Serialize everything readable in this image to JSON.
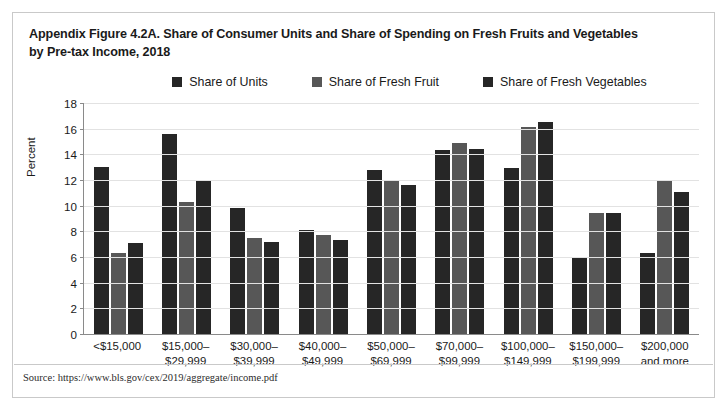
{
  "figure": {
    "title_line1": "Appendix Figure 4.2A. Share of Consumer Units and Share of Spending on Fresh Fruits and Vegetables",
    "title_line2": "by Pre-tax Income, 2018",
    "source": "Source: https://www.bls.gov/cex/2019/aggregate/income.pdf"
  },
  "colors": {
    "series1": "#262626",
    "series2": "#575757",
    "series3": "#262626",
    "axis": "#8a8a8a",
    "grid": "#e2e2e2",
    "border": "#c9c9c9",
    "text": "#1a1a1a"
  },
  "chart_data": {
    "type": "bar",
    "title": "Appendix Figure 4.2A. Share of Consumer Units and Share of Spending on Fresh Fruits and Vegetables by Pre-tax Income, 2018",
    "xlabel": "",
    "ylabel": "Percent",
    "ylim": [
      0,
      18
    ],
    "yticks": [
      0,
      2,
      4,
      6,
      8,
      10,
      12,
      14,
      16,
      18
    ],
    "grid": true,
    "legend_position": "top-center",
    "categories": [
      "<$15,000",
      "$15,000–\n$29,999",
      "$30,000–\n$39,999",
      "$40,000–\n$49,999",
      "$50,000–\n$69,999",
      "$70,000–\n$99,999",
      "$100,000–\n$149,999",
      "$150,000–\n$199,999",
      "$200,000\nand more"
    ],
    "series": [
      {
        "name": "Share of Units",
        "color": "#262626",
        "values": [
          13.0,
          15.6,
          9.8,
          8.1,
          12.8,
          14.3,
          12.9,
          6.0,
          6.3
        ]
      },
      {
        "name": "Share of Fresh Fruit",
        "color": "#575757",
        "values": [
          6.3,
          10.3,
          7.5,
          7.7,
          12.0,
          14.9,
          16.1,
          9.4,
          12.0
        ]
      },
      {
        "name": "Share of Fresh Vegetables",
        "color": "#262626",
        "values": [
          7.1,
          12.0,
          7.2,
          7.3,
          11.6,
          14.4,
          16.5,
          9.4,
          11.1
        ]
      }
    ]
  }
}
